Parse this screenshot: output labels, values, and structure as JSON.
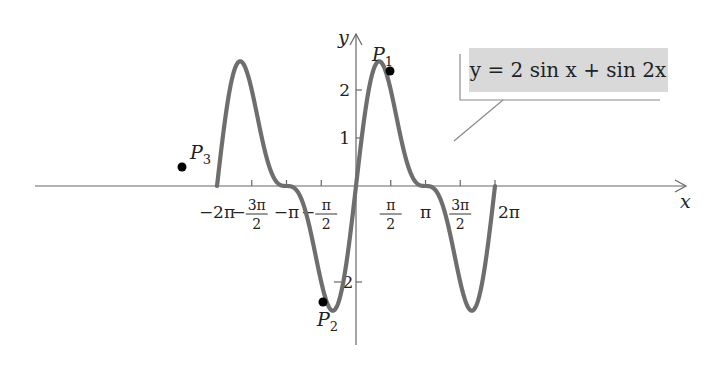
{
  "chart_data": {
    "type": "line",
    "title": "",
    "function_label": "y = 2 sin x + sin 2x",
    "xlabel": "x",
    "ylabel": "y",
    "xlim": [
      -6.2832,
      6.2832
    ],
    "ylim": [
      -2.6,
      2.6
    ],
    "x_ticks": [
      {
        "value": -6.2832,
        "label": "−2π"
      },
      {
        "value": -4.7124,
        "label": "−3π/2"
      },
      {
        "value": -3.1416,
        "label": "−π"
      },
      {
        "value": -1.5708,
        "label": "−π/2"
      },
      {
        "value": 1.5708,
        "label": "π/2"
      },
      {
        "value": 3.1416,
        "label": "π"
      },
      {
        "value": 4.7124,
        "label": "3π/2"
      },
      {
        "value": 6.2832,
        "label": "2π"
      }
    ],
    "y_ticks": [
      {
        "value": 1,
        "label": "1"
      },
      {
        "value": 2,
        "label": "2"
      },
      {
        "value": -2,
        "label": "−2"
      }
    ],
    "series": [
      {
        "name": "y = 2 sin x + sin 2x",
        "expression": "2*sin(x)+sin(2*x)",
        "color": "#6e6e6e"
      }
    ],
    "points": [
      {
        "label": "P1",
        "x": 0.5,
        "y": 2.5
      },
      {
        "label": "P2",
        "x": -0.6,
        "y": -2.06
      },
      {
        "label": "P3",
        "x": -3.9,
        "y": 0.34
      }
    ],
    "grid": false,
    "legend": "callout box top-right"
  }
}
